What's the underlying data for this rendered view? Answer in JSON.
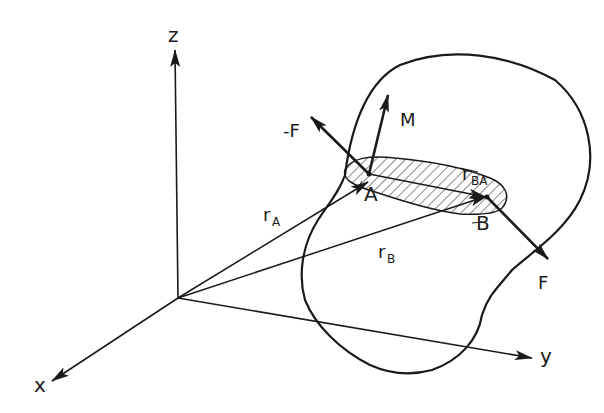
{
  "figure": {
    "colors": {
      "ink": "#1a1a1a",
      "background": "#ffffff"
    }
  },
  "axes": {
    "z": "z",
    "x": "x",
    "y": "y"
  },
  "vectors": {
    "neg_force": "-F",
    "force": "F",
    "moment": "M",
    "r_a_main": "r",
    "r_a_sub": "A",
    "r_b_main": "r",
    "r_b_sub": "B",
    "r_ba_main": "r",
    "r_ba_sub": "BA"
  },
  "points": {
    "a": "A",
    "b": "B"
  }
}
